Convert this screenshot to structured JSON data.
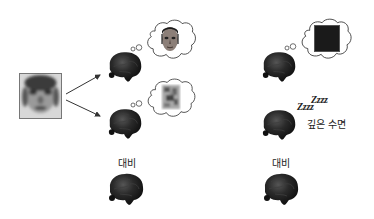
{
  "diagram": {
    "left_panel": {
      "input_image": {
        "icon": "blurry-face-image"
      },
      "arrows": [
        "arrow-to-brain-face",
        "arrow-to-brain-noise"
      ],
      "brain_face": {
        "icon": "brain-icon",
        "thought": "face-image"
      },
      "brain_noise": {
        "icon": "brain-icon",
        "thought": "noise-image"
      },
      "contrast_label": "대비",
      "brain_contrast": {
        "icon": "brain-icon"
      }
    },
    "right_panel": {
      "brain_dark": {
        "icon": "brain-icon",
        "thought": "black-square"
      },
      "sleep_zzz_1": "Zzzz",
      "sleep_zzz_2": "Zzzz",
      "deep_sleep_label": "깊은 수면",
      "brain_sleep": {
        "icon": "brain-icon"
      },
      "contrast_label": "대비",
      "brain_contrast": {
        "icon": "brain-icon"
      }
    },
    "colors": {
      "brain": "#1e1e1e",
      "outline": "#555555",
      "background": "#ffffff"
    }
  }
}
